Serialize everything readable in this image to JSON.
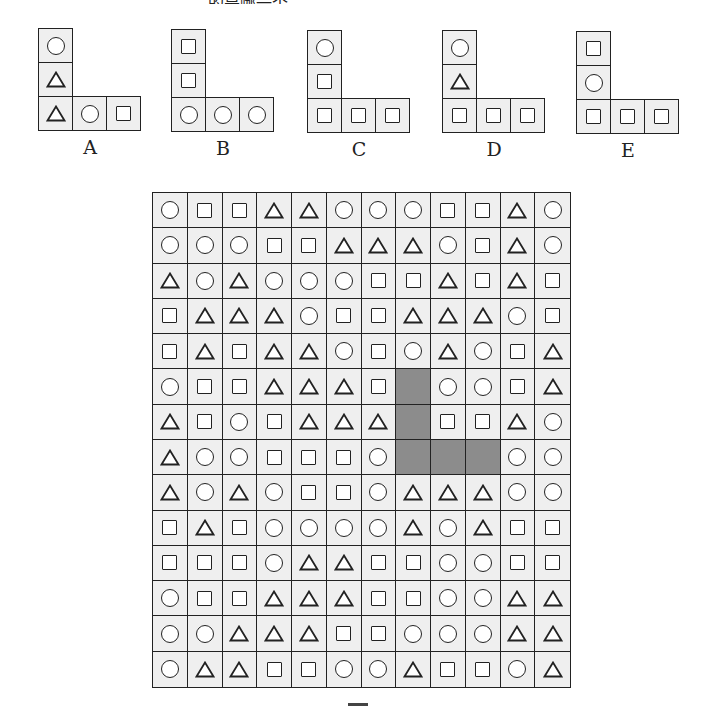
{
  "header_fragment": "…………………………………的是哪一个…",
  "options": [
    {
      "label": "A",
      "vertical": [
        "O",
        "T"
      ],
      "horizontal": [
        "T",
        "O",
        "S"
      ],
      "x": 38,
      "y": 28
    },
    {
      "label": "B",
      "vertical": [
        "S",
        "S"
      ],
      "horizontal": [
        "O",
        "O",
        "O"
      ],
      "x": 171,
      "y": 29
    },
    {
      "label": "C",
      "vertical": [
        "O",
        "S"
      ],
      "horizontal": [
        "S",
        "S",
        "S"
      ],
      "x": 307,
      "y": 30
    },
    {
      "label": "D",
      "vertical": [
        "O",
        "T"
      ],
      "horizontal": [
        "S",
        "S",
        "S"
      ],
      "x": 442,
      "y": 30
    },
    {
      "label": "E",
      "vertical": [
        "S",
        "O"
      ],
      "horizontal": [
        "S",
        "S",
        "S"
      ],
      "x": 576,
      "y": 31
    }
  ],
  "shape_legend": {
    "O": "circle",
    "S": "square",
    "T": "triangle",
    "X": "shaded-blank"
  },
  "grid": {
    "rows": 14,
    "cols": 12,
    "cells": [
      [
        "O",
        "S",
        "S",
        "T",
        "T",
        "O",
        "O",
        "O",
        "S",
        "S",
        "T",
        "O"
      ],
      [
        "O",
        "O",
        "O",
        "S",
        "S",
        "T",
        "T",
        "T",
        "O",
        "S",
        "T",
        "O"
      ],
      [
        "T",
        "O",
        "T",
        "O",
        "O",
        "O",
        "S",
        "S",
        "T",
        "S",
        "T",
        "S"
      ],
      [
        "S",
        "T",
        "T",
        "T",
        "O",
        "S",
        "S",
        "T",
        "T",
        "T",
        "O",
        "S"
      ],
      [
        "S",
        "T",
        "S",
        "T",
        "T",
        "O",
        "S",
        "O",
        "T",
        "O",
        "S",
        "T"
      ],
      [
        "O",
        "S",
        "S",
        "T",
        "T",
        "T",
        "S",
        "X",
        "O",
        "O",
        "S",
        "T"
      ],
      [
        "T",
        "S",
        "O",
        "S",
        "T",
        "T",
        "T",
        "X",
        "S",
        "S",
        "T",
        "O"
      ],
      [
        "T",
        "O",
        "O",
        "S",
        "S",
        "S",
        "O",
        "X",
        "X",
        "X",
        "O",
        "O"
      ],
      [
        "T",
        "O",
        "T",
        "O",
        "S",
        "S",
        "O",
        "T",
        "T",
        "T",
        "O",
        "O"
      ],
      [
        "S",
        "T",
        "S",
        "O",
        "O",
        "O",
        "O",
        "T",
        "O",
        "T",
        "S",
        "S"
      ],
      [
        "S",
        "S",
        "S",
        "O",
        "T",
        "T",
        "S",
        "S",
        "O",
        "O",
        "S",
        "S"
      ],
      [
        "O",
        "S",
        "S",
        "T",
        "T",
        "T",
        "S",
        "S",
        "O",
        "O",
        "T",
        "T"
      ],
      [
        "O",
        "O",
        "T",
        "T",
        "T",
        "S",
        "S",
        "O",
        "O",
        "O",
        "T",
        "T"
      ],
      [
        "O",
        "T",
        "T",
        "S",
        "S",
        "O",
        "O",
        "T",
        "S",
        "S",
        "O",
        "T"
      ]
    ],
    "shaded_region_color": "#8c8c8c"
  },
  "figure_caption": "图"
}
